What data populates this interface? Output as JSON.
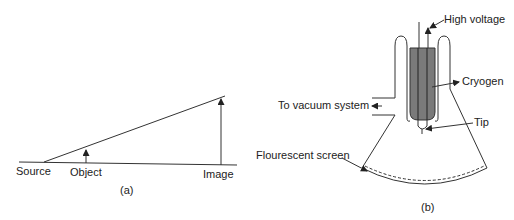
{
  "figure_a": {
    "caption": "(a)",
    "labels": {
      "source": "Source",
      "object": "Object",
      "image": "Image"
    }
  },
  "figure_b": {
    "caption": "(b)",
    "labels": {
      "high_voltage": "High voltage",
      "cryogen": "Cryogen",
      "vacuum": "To vacuum system",
      "tip": "Tip",
      "screen": "Flourescent screen"
    }
  },
  "colors": {
    "line": "#333333",
    "cryogen_fill": "#7a7a7a"
  }
}
